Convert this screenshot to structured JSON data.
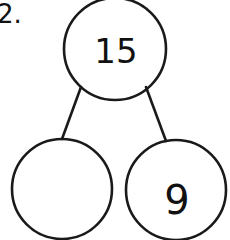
{
  "problem": {
    "number_label": "2."
  },
  "number_bond": {
    "whole": "15",
    "parts": [
      {
        "position": "left",
        "value": ""
      },
      {
        "position": "right",
        "value": "9"
      }
    ]
  },
  "style": {
    "stroke_color": "#1a1a1a",
    "text_color": "#111111",
    "background": "#ffffff"
  }
}
